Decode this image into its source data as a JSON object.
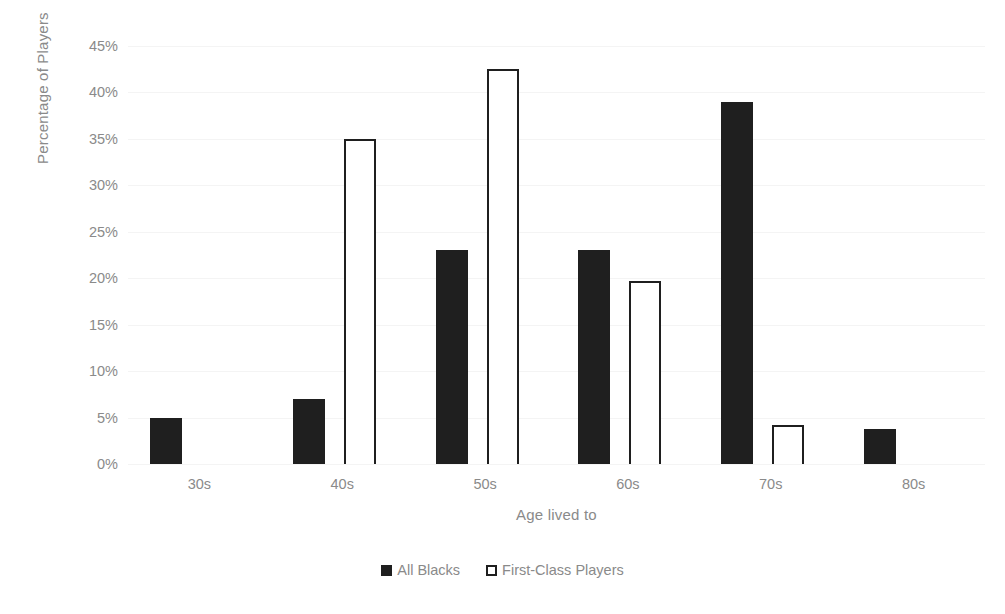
{
  "chart_data": {
    "type": "bar",
    "title": "",
    "subtitle": "",
    "xlabel": "Age lived to",
    "ylabel": "Percentage of Players",
    "categories": [
      "30s",
      "40s",
      "50s",
      "60s",
      "70s",
      "80s"
    ],
    "series": [
      {
        "name": "All Blacks",
        "color": "#1f1f1f",
        "style": "filled",
        "values": [
          5,
          7,
          23,
          23,
          39,
          3.8
        ]
      },
      {
        "name": "First-Class Players",
        "color": "#ffffff",
        "edge_color": "#1f1f1f",
        "style": "hollow",
        "values": [
          0,
          35,
          42.5,
          19.7,
          4.2,
          0
        ]
      }
    ],
    "ylim": [
      0,
      45
    ],
    "ytick_values": [
      0,
      5,
      10,
      15,
      20,
      25,
      30,
      35,
      40,
      45
    ],
    "ytick_labels": [
      "0%",
      "5%",
      "10%",
      "15%",
      "20%",
      "25%",
      "30%",
      "35%",
      "40%",
      "45%"
    ],
    "grid": true,
    "grid_axis": "y",
    "grid_color": "#f4f4f4",
    "legend_position": "bottom",
    "legend_entries": [
      "All Blacks",
      "First-Class Players"
    ],
    "annotations": [],
    "background_color": "#ffffff",
    "text_color": "#8a8a8a"
  },
  "legend": {
    "items": [
      {
        "label": "All Blacks",
        "swatch": "filled-square-icon"
      },
      {
        "label": "First-Class Players",
        "swatch": "hollow-square-icon"
      }
    ]
  }
}
